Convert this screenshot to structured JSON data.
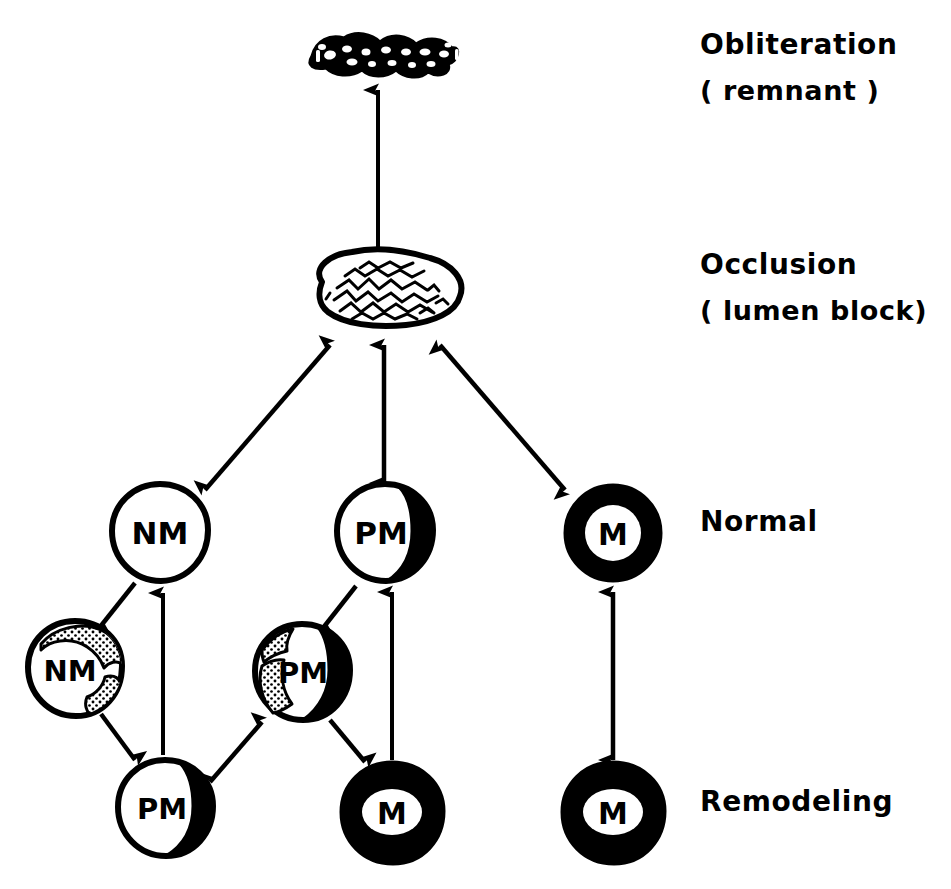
{
  "figure": {
    "background_color": "#ffffff",
    "ink_color": "#000000"
  },
  "stage_labels": [
    {
      "id": "obliteration",
      "line1": "Obliteration",
      "line2": "( remnant )",
      "x": 700,
      "y": 28
    },
    {
      "id": "occlusion",
      "line1": "Occlusion",
      "line2": "( lumen block)",
      "x": 700,
      "y": 248
    },
    {
      "id": "normal",
      "line1": "Normal",
      "line2": "",
      "x": 700,
      "y": 505
    },
    {
      "id": "remodeling",
      "line1": "Remodeling",
      "line2": "",
      "x": 700,
      "y": 785
    }
  ],
  "nodes": [
    {
      "id": "remnant",
      "label": "",
      "type": "remnant-blob",
      "cx": 383,
      "cy": 55
    },
    {
      "id": "occlusion-blob",
      "label": "",
      "type": "occlusion-blob",
      "cx": 383,
      "cy": 288
    },
    {
      "id": "normal-nm",
      "label": "NM",
      "type": "thin-outline",
      "cx": 160,
      "cy": 532,
      "r": 48
    },
    {
      "id": "normal-pm",
      "label": "PM",
      "type": "eccentric-crescent",
      "cx": 385,
      "cy": 532,
      "r": 48
    },
    {
      "id": "normal-m",
      "label": "M",
      "type": "thick-ring",
      "cx": 613,
      "cy": 533,
      "r": 48
    },
    {
      "id": "remodel-nm-stippled",
      "label": "NM",
      "type": "stippled-outline",
      "cx": 75,
      "cy": 668,
      "r": 47
    },
    {
      "id": "remodel-pm-stippled",
      "label": "PM",
      "type": "stippled-crescent",
      "cx": 302,
      "cy": 672,
      "r": 48
    },
    {
      "id": "remodel-pm",
      "label": "PM",
      "type": "eccentric-crescent",
      "cx": 165,
      "cy": 808,
      "r": 48
    },
    {
      "id": "remodel-m-mid",
      "label": "M",
      "type": "solid-lumen",
      "cx": 392,
      "cy": 812,
      "r": 50
    },
    {
      "id": "remodel-m-right",
      "label": "M",
      "type": "solid-lumen",
      "cx": 613,
      "cy": 812,
      "r": 50
    }
  ],
  "arrows": [
    {
      "id": "occlusion-to-remnant",
      "from": "occlusion-blob",
      "to": "remnant",
      "heads": "single"
    },
    {
      "id": "nm-to-occlusion",
      "from": "normal-nm",
      "to": "occlusion-blob",
      "heads": "double"
    },
    {
      "id": "pm-to-occlusion",
      "from": "normal-pm",
      "to": "occlusion-blob",
      "heads": "double"
    },
    {
      "id": "m-to-occlusion",
      "from": "normal-m",
      "to": "occlusion-blob",
      "heads": "double"
    },
    {
      "id": "normal-nm-to-remodel-nm",
      "from": "normal-nm",
      "to": "remodel-nm-stippled",
      "heads": "single"
    },
    {
      "id": "remodel-nm-to-remodel-pm",
      "from": "remodel-nm-stippled",
      "to": "remodel-pm",
      "heads": "single"
    },
    {
      "id": "remodel-pm-to-normal-nm",
      "from": "remodel-pm",
      "to": "normal-nm",
      "heads": "single"
    },
    {
      "id": "remodel-pm-to-remodel-pm-stippled",
      "from": "remodel-pm",
      "to": "remodel-pm-stippled",
      "heads": "double"
    },
    {
      "id": "normal-pm-to-remodel-pm-stippled",
      "from": "normal-pm",
      "to": "remodel-pm-stippled",
      "heads": "single"
    },
    {
      "id": "remodel-pm-stippled-to-remodel-m",
      "from": "remodel-pm-stippled",
      "to": "remodel-m-mid",
      "heads": "single"
    },
    {
      "id": "remodel-m-to-normal-pm",
      "from": "remodel-m-mid",
      "to": "normal-pm",
      "heads": "single"
    },
    {
      "id": "normal-m-to-remodel-m",
      "from": "normal-m",
      "to": "remodel-m-right",
      "heads": "double"
    }
  ]
}
